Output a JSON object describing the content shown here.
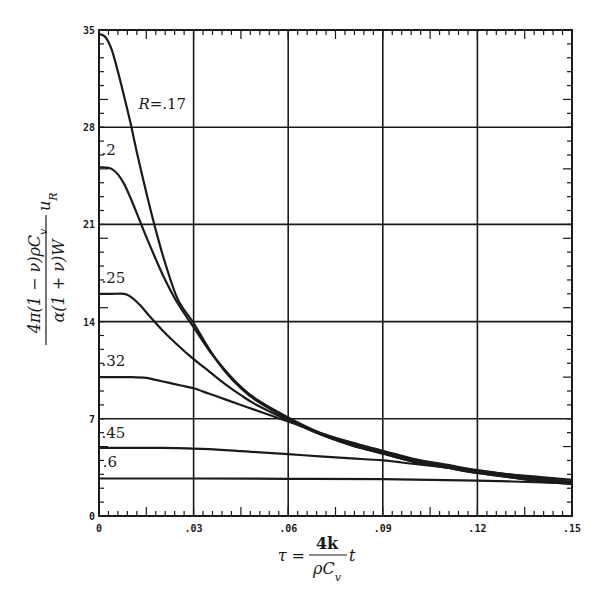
{
  "chart_data": {
    "type": "line",
    "title": "",
    "xlabel": "τ = (4k / ρC_v) t",
    "ylabel": "4π(1 − ν)ρC_v u_R / α(1 + ν)W",
    "xlim": [
      0,
      0.15
    ],
    "ylim": [
      0,
      35
    ],
    "grid": true,
    "x_ticks": [
      0,
      0.03,
      0.06,
      0.09,
      0.12,
      0.15
    ],
    "x_tick_labels": [
      "0",
      ".03",
      ".06",
      ".09",
      ".12",
      ".15"
    ],
    "y_ticks": [
      0,
      7,
      14,
      21,
      28,
      35
    ],
    "y_tick_labels": [
      "0",
      "7",
      "14",
      "21",
      "28",
      "35"
    ],
    "legend": "inline curve labels",
    "series": [
      {
        "name": "R=.17",
        "label": "R=.17",
        "label_pos": [
          0.0045,
          29.2
        ],
        "x": [
          0,
          0.002,
          0.004,
          0.006,
          0.008,
          0.01,
          0.012,
          0.015,
          0.018,
          0.021,
          0.025,
          0.03,
          0.035,
          0.04,
          0.045,
          0.05,
          0.06,
          0.07,
          0.08,
          0.09,
          0.1,
          0.11,
          0.12,
          0.13,
          0.14,
          0.15
        ],
        "y": [
          34.7,
          34.5,
          33.6,
          32.0,
          30.2,
          28.3,
          26.2,
          23.3,
          20.6,
          18.2,
          15.6,
          13.9,
          12.0,
          10.4,
          9.2,
          8.3,
          7.0,
          5.9,
          5.1,
          4.5,
          3.9,
          3.5,
          3.1,
          2.8,
          2.55,
          2.35
        ]
      },
      {
        "name": "R=.2",
        "label": ".2",
        "label_pos": [
          0.0008,
          26.0
        ],
        "x": [
          0,
          0.002,
          0.004,
          0.006,
          0.008,
          0.01,
          0.012,
          0.015,
          0.018,
          0.021,
          0.025,
          0.03,
          0.035,
          0.04,
          0.045,
          0.05,
          0.06,
          0.07,
          0.08,
          0.09,
          0.1,
          0.11,
          0.12,
          0.13,
          0.14,
          0.15
        ],
        "y": [
          25.1,
          25.1,
          25.0,
          24.6,
          23.9,
          22.9,
          21.8,
          20.1,
          18.5,
          17.0,
          15.3,
          13.6,
          11.9,
          10.5,
          9.3,
          8.4,
          7.1,
          6.0,
          5.2,
          4.6,
          4.0,
          3.6,
          3.2,
          2.9,
          2.65,
          2.45
        ]
      },
      {
        "name": "R=.25",
        "label": ".25",
        "label_pos": [
          0.0008,
          16.8
        ],
        "x": [
          0,
          0.004,
          0.008,
          0.01,
          0.013,
          0.016,
          0.02,
          0.025,
          0.03,
          0.035,
          0.04,
          0.045,
          0.05,
          0.06,
          0.07,
          0.08,
          0.09,
          0.1,
          0.11,
          0.12,
          0.13,
          0.14,
          0.15
        ],
        "y": [
          16.0,
          16.0,
          16.0,
          15.8,
          15.2,
          14.4,
          13.4,
          12.3,
          11.3,
          10.4,
          9.5,
          8.7,
          8.0,
          6.9,
          5.9,
          5.1,
          4.5,
          3.9,
          3.5,
          3.1,
          2.8,
          2.5,
          2.3
        ]
      },
      {
        "name": "R=.32",
        "label": ".32",
        "label_pos": [
          0.0008,
          10.8
        ],
        "x": [
          0,
          0.005,
          0.01,
          0.015,
          0.018,
          0.022,
          0.026,
          0.03,
          0.035,
          0.04,
          0.045,
          0.05,
          0.055,
          0.06,
          0.07,
          0.08,
          0.09,
          0.1,
          0.11,
          0.12,
          0.13,
          0.14,
          0.15
        ],
        "y": [
          10.0,
          10.0,
          10.0,
          9.95,
          9.8,
          9.6,
          9.4,
          9.2,
          8.8,
          8.4,
          8.0,
          7.6,
          7.2,
          6.8,
          6.0,
          5.3,
          4.7,
          4.1,
          3.7,
          3.3,
          3.0,
          2.7,
          2.45
        ]
      },
      {
        "name": "R=.45",
        "label": ".45",
        "label_pos": [
          0.0008,
          5.6
        ],
        "x": [
          0,
          0.01,
          0.02,
          0.03,
          0.04,
          0.05,
          0.06,
          0.07,
          0.08,
          0.09,
          0.1,
          0.11,
          0.12,
          0.13,
          0.14,
          0.15
        ],
        "y": [
          4.9,
          4.9,
          4.9,
          4.85,
          4.75,
          4.6,
          4.45,
          4.3,
          4.15,
          4.0,
          3.75,
          3.5,
          3.25,
          3.0,
          2.8,
          2.6
        ]
      },
      {
        "name": "R=.6",
        "label": ".6",
        "label_pos": [
          0.0012,
          3.5
        ],
        "x": [
          0,
          0.03,
          0.06,
          0.09,
          0.12,
          0.15
        ],
        "y": [
          2.7,
          2.7,
          2.68,
          2.65,
          2.55,
          2.35
        ]
      }
    ]
  },
  "axes": {
    "y_label_parts": {
      "numerator": "4π(1 − ν)ρC",
      "num_sub": "v",
      "denominator": "α(1 + ν)W",
      "tail": "u",
      "tail_sub": "R"
    },
    "x_label_parts": {
      "lhs": "τ =",
      "numerator": "4k",
      "denominator": "ρC",
      "den_sub": "v",
      "tail": "t"
    }
  }
}
